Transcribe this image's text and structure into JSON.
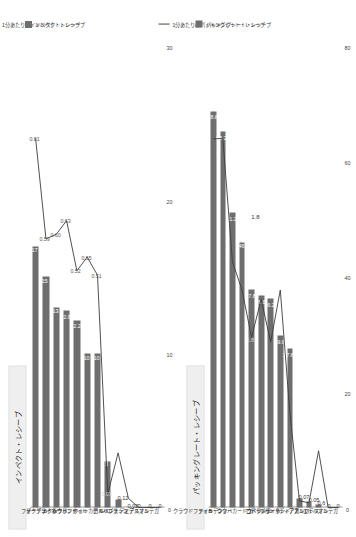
{
  "chart_data": [
    {
      "type": "bar",
      "id": "left",
      "title": "インペクト・レシーブ",
      "xlabel": "",
      "ylabel": "",
      "ylim": [
        0,
        30
      ],
      "ticks": [
        "0",
        "10",
        "20",
        "30"
      ],
      "grid": false,
      "legend_position": "right",
      "legend": [
        {
          "label": "1分あたりのインペクト・レシーブ",
          "marker": "line"
        },
        {
          "label": "インペクト・レシーブ",
          "marker": "bar"
        }
      ],
      "categories": [
        "ドク",
        "フォーデン",
        "デ・ブライネ",
        "B・シウバ",
        "ハーランド",
        "クラウドファイル",
        "ウォーカー",
        "ロドリ",
        "アルバレス",
        "ブラシン",
        "ルベン・ディアス",
        "エデルソン",
        "オルテガ"
      ],
      "series": [
        {
          "name": "インペクト・レシーブ",
          "type": "bar",
          "values": [
            17,
            15,
            13,
            12.8,
            12.2,
            10,
            10,
            3,
            0.5,
            0,
            0,
            0,
            0
          ],
          "labels": [
            "17",
            "15",
            "13",
            "12.8",
            "12.2",
            "10",
            "10",
            "3",
            "",
            "",
            "",
            "",
            ""
          ]
        },
        {
          "name": "1分あたりのインペクト・レシーブ",
          "type": "line",
          "values": [
            0.81,
            0.59,
            0.6,
            0.63,
            0.52,
            0.55,
            0.51,
            0.03,
            0.12,
            0.02,
            0,
            0,
            0
          ],
          "labels": [
            "0.81",
            "0.59",
            "0.60",
            "0.63",
            "0.52",
            "0.55",
            "0.51",
            "0.03",
            "0.12",
            "0.02",
            "0",
            "0",
            "0"
          ]
        }
      ]
    },
    {
      "type": "bar",
      "id": "right",
      "title": "パッキングレート・レシーブ",
      "xlabel": "",
      "ylabel": "",
      "ylim": [
        0,
        80
      ],
      "ticks": [
        "0",
        "20",
        "40",
        "60",
        "80"
      ],
      "grid": false,
      "legend_position": "right",
      "legend": [
        {
          "label": "1分あたりのパッキングレート・レシーブ",
          "marker": "line"
        },
        {
          "label": "パッキングレート・レシーブ",
          "marker": "bar"
        }
      ],
      "categories": [
        "クラウドファイル",
        "フォーデン",
        "B・シウバ",
        "ウォーカー",
        "ドク",
        "ロドリ",
        "コバチッチ",
        "デ・ブライネ",
        "ハーランド",
        "ルベン・ディアス",
        "アカンジ",
        "アルバレス",
        "エデルソン",
        "オルテガ"
      ],
      "series": [
        {
          "name": "パッキングレート・レシーブ",
          "type": "bar",
          "values": [
            68.8,
            65.2,
            51.2,
            46,
            37.8,
            36.8,
            36.2,
            29.8,
            27.6,
            1.5,
            1.1,
            0.6,
            0,
            0
          ],
          "labels": [
            "68.8",
            "65.2",
            "51.2",
            "46",
            "37.8",
            "36.8",
            "36.2",
            "29.8",
            "27.6",
            "",
            "",
            "",
            "",
            ""
          ]
        },
        {
          "name": "1分あたりのパッキングレート・レシーブ",
          "type": "line",
          "values": [
            3.9,
            3.9,
            2.6,
            2.3,
            1.8,
            2.2,
            1.75,
            2.3,
            1.0,
            0.07,
            0.05,
            0.6,
            0,
            0
          ],
          "labels": [
            "",
            "",
            "",
            "",
            "1.8",
            "",
            "",
            "",
            "",
            "0.07",
            "0.05",
            "0.6",
            "0",
            "0"
          ]
        },
        {
          "name": "callout",
          "type": "annotation",
          "labels": [
            "1.8"
          ]
        }
      ]
    }
  ]
}
